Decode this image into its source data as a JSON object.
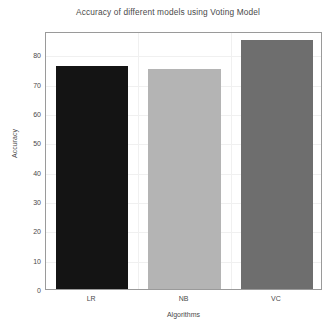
{
  "chart_data": {
    "type": "bar",
    "title": "Accuracy of different models using Voting Model",
    "xlabel": "Algorithms",
    "ylabel": "Accuracy",
    "categories": [
      "LR",
      "NB",
      "VC"
    ],
    "values": [
      76,
      75,
      85
    ],
    "series": [
      {
        "name": "Accuracy",
        "values": [
          76,
          75,
          85
        ]
      }
    ],
    "bar_colors": [
      "#141414",
      "#b4b4b4",
      "#6e6e6e"
    ],
    "ylim": [
      0,
      88
    ],
    "yticks": [
      0,
      10,
      20,
      30,
      40,
      50,
      60,
      70,
      80
    ],
    "ytick_labels": [
      "0",
      "10",
      "20",
      "30",
      "40",
      "50",
      "60",
      "70",
      "80"
    ],
    "grid": true,
    "grid_color": "#f0f0f0",
    "legend": null,
    "background_color": "#ffffff",
    "axis_color": "#9a9a9a",
    "text_color": "#4a4a4a"
  }
}
